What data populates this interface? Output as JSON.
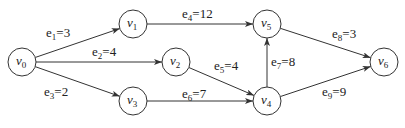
{
  "diagram": {
    "type": "directed-weighted-graph",
    "nodes": [
      {
        "id": "v0",
        "base": "v",
        "sub": "0",
        "x": 22,
        "y": 62
      },
      {
        "id": "v1",
        "base": "v",
        "sub": "1",
        "x": 133,
        "y": 24
      },
      {
        "id": "v2",
        "base": "v",
        "sub": "2",
        "x": 176,
        "y": 62
      },
      {
        "id": "v3",
        "base": "v",
        "sub": "3",
        "x": 133,
        "y": 101
      },
      {
        "id": "v4",
        "base": "v",
        "sub": "4",
        "x": 267,
        "y": 101
      },
      {
        "id": "v5",
        "base": "v",
        "sub": "5",
        "x": 267,
        "y": 24
      },
      {
        "id": "v6",
        "base": "v",
        "sub": "6",
        "x": 384,
        "y": 62
      }
    ],
    "edges": [
      {
        "id": "e1",
        "from": "v0",
        "to": "v1",
        "sub": "1",
        "weight": "3",
        "label_x": 46,
        "label_y": 37
      },
      {
        "id": "e2",
        "from": "v0",
        "to": "v2",
        "sub": "2",
        "weight": "4",
        "label_x": 92,
        "label_y": 56
      },
      {
        "id": "e3",
        "from": "v0",
        "to": "v3",
        "sub": "3",
        "weight": "2",
        "label_x": 44,
        "label_y": 96
      },
      {
        "id": "e4",
        "from": "v1",
        "to": "v5",
        "sub": "4",
        "weight": "12",
        "label_x": 182,
        "label_y": 18
      },
      {
        "id": "e5",
        "from": "v2",
        "to": "v4",
        "sub": "5",
        "weight": "4",
        "label_x": 214,
        "label_y": 70
      },
      {
        "id": "e6",
        "from": "v3",
        "to": "v4",
        "sub": "6",
        "weight": "7",
        "label_x": 182,
        "label_y": 98
      },
      {
        "id": "e7",
        "from": "v4",
        "to": "v5",
        "sub": "7",
        "weight": "8",
        "label_x": 271,
        "label_y": 66
      },
      {
        "id": "e8",
        "from": "v5",
        "to": "v6",
        "sub": "8",
        "weight": "3",
        "label_x": 332,
        "label_y": 38
      },
      {
        "id": "e9",
        "from": "v4",
        "to": "v6",
        "sub": "9",
        "weight": "9",
        "label_x": 322,
        "label_y": 96
      }
    ]
  }
}
